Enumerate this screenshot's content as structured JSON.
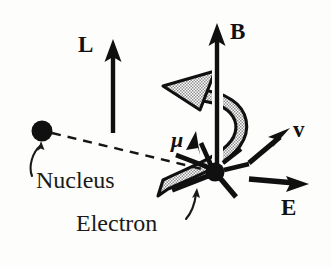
{
  "figure": {
    "kind": "physics-vector-diagram",
    "background_color": "#fdfdfb",
    "ink_color": "#111111",
    "stipple_fill_color": "#b4b4b4",
    "width": 331,
    "height": 267
  },
  "vectors": {
    "angular_momentum": {
      "label": "L",
      "description": "vertical solid arrow pointing up, left of center",
      "style": "solid-black",
      "tail": [
        113,
        133
      ],
      "tip": [
        113,
        41
      ]
    },
    "magnetic_field": {
      "label": "B",
      "description": "vertical solid arrow pointing up, right of center",
      "style": "solid-black",
      "tail": [
        217,
        172
      ],
      "tip": [
        217,
        25
      ]
    },
    "magnetic_moment": {
      "label": "μ",
      "description": "short solid arrow from electron pointing up and to the left",
      "style": "solid-black",
      "tail": [
        214,
        172
      ],
      "tip": [
        196,
        133
      ]
    },
    "velocity": {
      "label": "v",
      "description": "solid arrow pointing up and to the right",
      "style": "solid-black",
      "tail": [
        249,
        162
      ],
      "tip": [
        288,
        129
      ]
    },
    "electric_field": {
      "label": "E",
      "description": "horizontal solid arrow pointing right",
      "style": "solid-black",
      "tail": [
        249,
        186
      ],
      "tip": [
        308,
        183
      ]
    },
    "precession": {
      "label": "",
      "description": "broad stippled curved band arrow sweeping around B, arrowhead at upper left",
      "style": "stippled-band",
      "arrowhead_tip": [
        163,
        86
      ]
    }
  },
  "particles": {
    "nucleus": {
      "label": "Nucleus",
      "shape": "filled-circle",
      "center": [
        42,
        131
      ],
      "radius": 10
    },
    "electron": {
      "label": "Electron",
      "shape": "filled-circle",
      "center": [
        215,
        172
      ],
      "radius": 9
    }
  },
  "connectors": {
    "orbit_radius": {
      "description": "dashed straight line from nucleus to electron",
      "style": "dashed",
      "from": [
        52,
        133
      ],
      "to": [
        206,
        170
      ]
    },
    "nucleus_leader": {
      "description": "curved leader arrow from the word Nucleus up to the nucleus dot",
      "style": "thin-curved-arrow"
    },
    "electron_leader": {
      "description": "curved leader arrow from the word Electron up to the electron dot",
      "style": "thin-curved-arrow"
    }
  },
  "spokes": {
    "description": "short black line segments radiating from the electron dot",
    "count": 5
  }
}
